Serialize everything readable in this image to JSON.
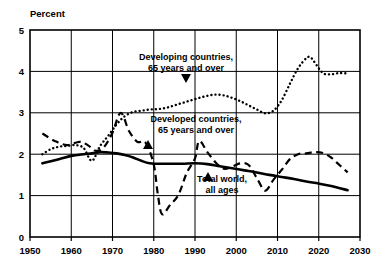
{
  "chart_data": {
    "type": "line",
    "title": "",
    "ylabel": "Percent",
    "xlabel": "",
    "xlim": [
      1950,
      2030
    ],
    "ylim": [
      0,
      5
    ],
    "grid": true,
    "legend_position": "inline-annotations",
    "xticks": [
      "1950",
      "1960",
      "1970",
      "1980",
      "1990",
      "2000",
      "2010",
      "2020",
      "2030"
    ],
    "yticks": [
      "0",
      "1",
      "2",
      "3",
      "4",
      "5"
    ],
    "annotations": [
      {
        "id": "developing",
        "line1": "Developing countries,",
        "line2": "65 years and over",
        "arrow": "down"
      },
      {
        "id": "developed",
        "line1": "Developed countries,",
        "line2": "65 years and over",
        "arrow": "up"
      },
      {
        "id": "total-world",
        "line1": "Total world,",
        "line2": "all ages",
        "arrow": "up"
      }
    ],
    "series": [
      {
        "name": "Developing countries, 65 years and over",
        "style": "dotted",
        "color": "#000000",
        "x": [
          1953,
          1955,
          1957,
          1959,
          1961,
          1963,
          1965,
          1967,
          1969,
          1971,
          1973,
          1975,
          1977,
          1979,
          1981,
          1983,
          1985,
          1987,
          1989,
          1991,
          1993,
          1995,
          1997,
          1999,
          2001,
          2003,
          2005,
          2007,
          2009,
          2011,
          2013,
          2015,
          2017,
          2018,
          2019,
          2021,
          2023,
          2025,
          2027
        ],
        "y": [
          2.0,
          2.12,
          2.18,
          2.2,
          2.22,
          2.15,
          1.84,
          2.2,
          2.45,
          2.72,
          2.92,
          3.02,
          3.05,
          3.08,
          3.09,
          3.12,
          3.18,
          3.24,
          3.3,
          3.36,
          3.41,
          3.44,
          3.42,
          3.36,
          3.28,
          3.18,
          3.08,
          2.99,
          3.05,
          3.3,
          3.7,
          4.08,
          4.32,
          4.34,
          4.22,
          3.96,
          3.93,
          3.96,
          3.95
        ]
      },
      {
        "name": "Developed countries, 65 years and over",
        "style": "dashed",
        "color": "#000000",
        "x": [
          1953,
          1956,
          1959,
          1962,
          1964,
          1966,
          1968,
          1970,
          1972,
          1974,
          1976,
          1978,
          1980,
          1981,
          1982,
          1984,
          1986,
          1988,
          1990,
          1991,
          1993,
          1995,
          1997,
          1999,
          2001,
          2003,
          2005,
          2007,
          2009,
          2011,
          2013,
          2015,
          2017,
          2019,
          2021,
          2023,
          2025,
          2027
        ],
        "y": [
          2.5,
          2.32,
          2.22,
          2.3,
          2.22,
          2.08,
          2.18,
          2.52,
          3.0,
          2.56,
          2.3,
          2.28,
          1.75,
          1.02,
          0.55,
          0.78,
          1.02,
          1.55,
          1.9,
          2.32,
          2.05,
          1.8,
          1.65,
          1.7,
          1.78,
          1.74,
          1.42,
          1.12,
          1.38,
          1.62,
          1.88,
          2.0,
          2.02,
          2.05,
          2.03,
          1.92,
          1.74,
          1.56
        ]
      },
      {
        "name": "Total world, all ages",
        "style": "solid",
        "color": "#000000",
        "x": [
          1953,
          1957,
          1960,
          1963,
          1965,
          1967,
          1969,
          1971,
          1973,
          1975,
          1977,
          1979,
          1981,
          1984,
          1987,
          1990,
          1993,
          1996,
          1999,
          2002,
          2005,
          2008,
          2011,
          2014,
          2017,
          2020,
          2023,
          2027
        ],
        "y": [
          1.78,
          1.88,
          1.96,
          2.0,
          2.02,
          2.05,
          2.04,
          2.02,
          1.98,
          1.92,
          1.84,
          1.78,
          1.77,
          1.77,
          1.77,
          1.78,
          1.76,
          1.71,
          1.66,
          1.61,
          1.56,
          1.5,
          1.45,
          1.4,
          1.34,
          1.29,
          1.23,
          1.13
        ]
      }
    ]
  }
}
